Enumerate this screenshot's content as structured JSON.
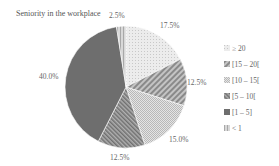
{
  "chart_data": {
    "type": "pie",
    "title": "Seniority in the workplace",
    "categories": [
      "≥ 20",
      "[15 – 20[",
      "[10 – 15[",
      "[5 – 10[",
      "[1 – 5]",
      "< 1"
    ],
    "values": [
      17.5,
      12.5,
      15.0,
      12.5,
      40.0,
      2.5
    ],
    "value_labels": [
      "17.5%",
      "12.5%",
      "15.0%",
      "12.5%",
      "40.0%",
      "2.5%"
    ],
    "unit": "%",
    "start_angle": "12 o'clock",
    "direction": "clockwise",
    "legend_position": "right",
    "fills": [
      "#e6e6e6",
      "#9a9a9a",
      "#d2d2d2",
      "#8c8c8c",
      "#6e6e6e",
      "#c4c4c4"
    ]
  },
  "title": "Seniority in the workplace",
  "labels": {
    "s0": "17.5%",
    "s1": "12.5%",
    "s2": "15.0%",
    "s3": "12.5%",
    "s4": "40.0%",
    "s5": "2.5%"
  },
  "legend": [
    "≥ 20",
    "[15 – 20[",
    "[10 – 15[",
    "[5 – 10[",
    "[1 – 5]",
    "< 1"
  ]
}
